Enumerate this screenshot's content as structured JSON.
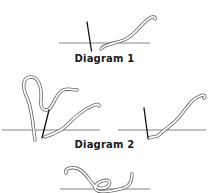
{
  "diagrams": [
    {
      "id": 1,
      "caption": "Diagram 1"
    },
    {
      "id": 2,
      "caption": "Diagram 2"
    },
    {
      "id": 3,
      "caption": ""
    }
  ],
  "colors": {
    "line": "#555555",
    "needle": "#111111",
    "yarn_outline": "#666666",
    "yarn_fill": "#ffffff",
    "background": "#ffffff"
  }
}
